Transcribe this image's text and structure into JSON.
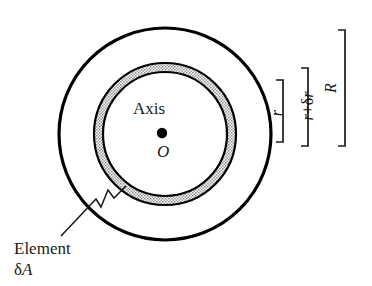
{
  "figure": {
    "background_color": "#ffffff",
    "stroke_color": "#000000",
    "annulus_fill_color": "#b3b3b3",
    "outer_circle": {
      "name": "shaft-outer-boundary",
      "center_x": 165,
      "center_y": 134,
      "radius": 106
    },
    "annulus": {
      "name": "element-annulus",
      "center_x": 165,
      "center_y": 134,
      "inner_radius": 62,
      "outer_radius": 71
    },
    "center_dot": {
      "name": "axis-point",
      "center_x": 162,
      "center_y": 133,
      "radius": 5
    },
    "labels": {
      "axis": "Axis",
      "origin": "O",
      "element": "Element",
      "element_area": "δA",
      "element_area_symbol": "δ",
      "element_area_var": "A"
    },
    "leader_line": {
      "name": "element-leader-line",
      "style": "zigzag"
    }
  },
  "dimensions": [
    {
      "name": "dimension-r",
      "label": "r",
      "label_plain": "r",
      "bracket_top": 80,
      "bracket_bottom": 142,
      "bracket_x": 283
    },
    {
      "name": "dimension-r-plus-delta-r",
      "label": "r+δr",
      "label_prefix": "r",
      "label_middle": "+δ",
      "label_suffix": "r",
      "bracket_top": 68,
      "bracket_bottom": 146,
      "bracket_x": 308
    },
    {
      "name": "dimension-R",
      "label": "R",
      "label_plain": "R",
      "bracket_top": 30,
      "bracket_bottom": 146,
      "bracket_x": 345
    }
  ]
}
